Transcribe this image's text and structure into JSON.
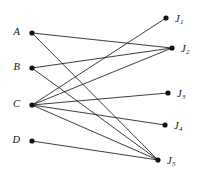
{
  "figure": {
    "name": "bipartite-assignment-graph",
    "background_color": "#ffffff",
    "edge_color": "#1b1b1b",
    "node_color": "#111111",
    "width": 201,
    "height": 181
  },
  "chart_data": {
    "type": "diagram",
    "diagram_type": "bipartite-graph",
    "title": "",
    "left_set_name": "",
    "right_set_name": "",
    "nodes": [
      {
        "id": "A",
        "label": "A",
        "sub": "",
        "x": 32,
        "y": 33,
        "side": "left",
        "label_x": 20,
        "label_y": 33
      },
      {
        "id": "B",
        "label": "B",
        "sub": "",
        "x": 32,
        "y": 68,
        "side": "left",
        "label_x": 20,
        "label_y": 68
      },
      {
        "id": "C",
        "label": "C",
        "sub": "",
        "x": 32,
        "y": 105,
        "side": "left",
        "label_x": 20,
        "label_y": 105
      },
      {
        "id": "D",
        "label": "D",
        "sub": "",
        "x": 32,
        "y": 141,
        "side": "left",
        "label_x": 20,
        "label_y": 141
      },
      {
        "id": "J1",
        "label": "J",
        "sub": "1",
        "x": 166,
        "y": 18,
        "side": "right",
        "label_x": 175,
        "label_y": 20
      },
      {
        "id": "J2",
        "label": "J",
        "sub": "2",
        "x": 172,
        "y": 48,
        "side": "right",
        "label_x": 181,
        "label_y": 50
      },
      {
        "id": "J3",
        "label": "J",
        "sub": "3",
        "x": 168,
        "y": 93,
        "side": "right",
        "label_x": 177,
        "label_y": 95
      },
      {
        "id": "J4",
        "label": "J",
        "sub": "4",
        "x": 165,
        "y": 125,
        "side": "right",
        "label_x": 174,
        "label_y": 127
      },
      {
        "id": "J5",
        "label": "J",
        "sub": "5",
        "x": 158,
        "y": 160,
        "side": "right",
        "label_x": 167,
        "label_y": 162
      }
    ],
    "edges": [
      {
        "from": "A",
        "to": "J2"
      },
      {
        "from": "A",
        "to": "J5"
      },
      {
        "from": "B",
        "to": "J2"
      },
      {
        "from": "B",
        "to": "J5"
      },
      {
        "from": "C",
        "to": "J1"
      },
      {
        "from": "C",
        "to": "J2"
      },
      {
        "from": "C",
        "to": "J3"
      },
      {
        "from": "C",
        "to": "J4"
      },
      {
        "from": "C",
        "to": "J5"
      },
      {
        "from": "D",
        "to": "J5"
      }
    ],
    "node_radius": 2.6,
    "degrees": {
      "A": 2,
      "B": 2,
      "C": 5,
      "D": 1,
      "J1": 1,
      "J2": 3,
      "J3": 1,
      "J4": 1,
      "J5": 4
    }
  }
}
